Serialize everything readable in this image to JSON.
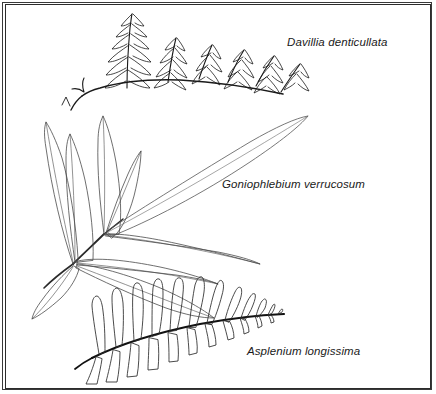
{
  "plate": {
    "type": "botanical-line-illustration",
    "background_color": "#ffffff",
    "ink_color": "#1a1a1a",
    "frame": {
      "style": "double-rule-rectangle",
      "color": "#333333"
    }
  },
  "specimens": [
    {
      "id": "davallia",
      "label": "Davillia denticullata",
      "position": "top",
      "frond_type": "bipinnate",
      "description": "Finely divided frond with deeply lobed, sharply toothed pinnae angled upward along a rachis descending to the left; slender stipe with a small basal fork."
    },
    {
      "id": "goniophlebium",
      "label": "Goniophlebium verrucosum",
      "position": "middle-left",
      "frond_type": "pinnate-entire",
      "description": "Long lanceolate entire leaflets with visible midribs radiating from two nodes on a stipe running to the lower left."
    },
    {
      "id": "asplenium",
      "label": "Asplenium longissima",
      "position": "bottom",
      "frond_type": "pinnate",
      "description": "Oblong blunt pinnae set above and below a dark gently arching rachis, tapering to small pinnae at the right tip."
    }
  ],
  "labels": {
    "davallia": "Davillia denticullata",
    "goniophlebium": "Goniophlebium verrucosum",
    "asplenium": "Asplenium longissima"
  }
}
